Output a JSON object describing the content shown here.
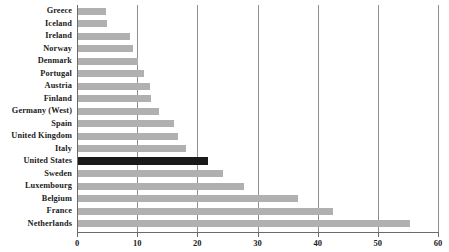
{
  "chart_data": {
    "type": "bar",
    "orientation": "horizontal",
    "title": "",
    "subtitle": "",
    "xlabel": "",
    "ylabel": "",
    "xlim": [
      0,
      60
    ],
    "xticks": [
      0,
      10,
      20,
      30,
      40,
      50,
      60
    ],
    "xtick_labels": [
      "0",
      "10",
      "20",
      "30",
      "40",
      "50",
      "60"
    ],
    "grid": "vertical",
    "legend": "none",
    "categories": [
      "Greece",
      "Iceland",
      "Ireland",
      "Norway",
      "Denmark",
      "Portugal",
      "Austria",
      "Finland",
      "Germany (West)",
      "Spain",
      "United Kingdom",
      "Italy",
      "United States",
      "Sweden",
      "Luxembourg",
      "Belgium",
      "France",
      "Netherlands"
    ],
    "values": [
      4.6,
      4.9,
      8.6,
      9.2,
      10.0,
      10.9,
      12.0,
      12.1,
      13.5,
      16.0,
      16.7,
      17.9,
      21.6,
      24.1,
      27.6,
      36.5,
      42.3,
      55.1
    ],
    "highlight_category": "United States",
    "colors": {
      "bar": "#b0b0b0",
      "bar_highlight": "#1a1a1a",
      "gridline": "#8e8e8e",
      "axis": "#6b6b6b",
      "text": "#1b1b1b",
      "background": "#ffffff"
    }
  }
}
